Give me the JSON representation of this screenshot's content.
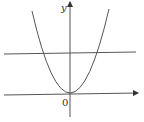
{
  "diagram": {
    "type": "coordinate-graph",
    "axes": {
      "y_label": "y",
      "origin_label": "0"
    },
    "curves": [
      {
        "name": "parabola",
        "description": "upward-opening parabola with vertex at origin"
      },
      {
        "name": "horizontal-line",
        "description": "horizontal line above the x-axis intersecting the parabola at two points"
      }
    ],
    "colors": {
      "stroke": "#555555",
      "background": "#ffffff"
    }
  }
}
